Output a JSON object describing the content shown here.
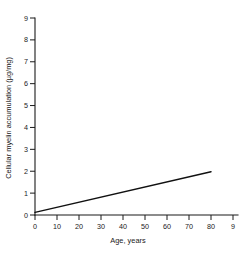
{
  "chart_data": {
    "type": "scatter",
    "title": "",
    "xlabel": "Age, years",
    "ylabel": "Cellular myelin accumulation (µg/mg)",
    "xlim": [
      0,
      90
    ],
    "ylim": [
      0,
      9
    ],
    "xticks": [
      0,
      10,
      20,
      30,
      40,
      50,
      60,
      70,
      80,
      90
    ],
    "xtick_labels": [
      "0",
      "10",
      "20",
      "30",
      "40",
      "50",
      "60",
      "70",
      "80",
      "9"
    ],
    "yticks": [
      0,
      1,
      2,
      3,
      4,
      5,
      6,
      7,
      8,
      9
    ],
    "ytick_labels": [
      "0",
      "1",
      "2",
      "3",
      "4",
      "5",
      "6",
      "7",
      "8",
      "9"
    ],
    "grid": false,
    "legend": "none",
    "series": [
      {
        "name": "filled-circles",
        "marker": "filled-circle",
        "color": "#111111",
        "points": [
          {
            "x": 44,
            "y": 4.05
          },
          {
            "x": 55,
            "y": 3.45
          },
          {
            "x": 59,
            "y": 3.5
          },
          {
            "x": 60,
            "y": 8.05
          },
          {
            "x": 75,
            "y": 5.85
          },
          {
            "x": 74,
            "y": 5.05
          },
          {
            "x": 79,
            "y": 4.15
          },
          {
            "x": 75,
            "y": 3.15
          }
        ]
      },
      {
        "name": "open-circles",
        "marker": "open-circle",
        "color": "#111111",
        "points": [
          {
            "x": 1,
            "y": 0.2
          },
          {
            "x": 12,
            "y": 0.62
          },
          {
            "x": 12,
            "y": 0.45
          },
          {
            "x": 35,
            "y": 0.87
          },
          {
            "x": 38,
            "y": 0.9
          },
          {
            "x": 42,
            "y": 0.9
          },
          {
            "x": 50,
            "y": 1.35
          },
          {
            "x": 56,
            "y": 1.52
          },
          {
            "x": 57,
            "y": 1.25
          },
          {
            "x": 60,
            "y": 1.45
          },
          {
            "x": 72,
            "y": 2.78
          }
        ]
      }
    ],
    "fit_line": {
      "name": "regression-line",
      "x0": 0,
      "y0": 0.12,
      "x1": 80,
      "y1": 1.98
    }
  }
}
